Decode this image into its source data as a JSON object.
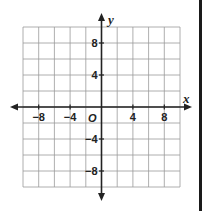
{
  "diagram": {
    "type": "coordinate-plane",
    "x_axis_label": "x",
    "y_axis_label": "y",
    "origin_label": "O",
    "x_range": [
      -10,
      10
    ],
    "y_range": [
      -10,
      10
    ],
    "grid_step": 2,
    "x_tick_labels": [
      {
        "value": -8,
        "text": "−8"
      },
      {
        "value": -4,
        "text": "−4"
      },
      {
        "value": 4,
        "text": "4"
      },
      {
        "value": 8,
        "text": "8"
      }
    ],
    "y_tick_labels": [
      {
        "value": 8,
        "text": "8"
      },
      {
        "value": 4,
        "text": "4"
      },
      {
        "value": -4,
        "text": "−4"
      },
      {
        "value": -8,
        "text": "−8"
      }
    ],
    "colors": {
      "grid": "#9a9a9a",
      "axis": "#222222",
      "border": "#1a1a1a"
    }
  }
}
